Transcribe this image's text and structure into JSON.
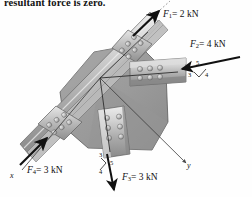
{
  "figure": {
    "caption_fragment": "resultant force is zero.",
    "type": "engineering-statics-diagram"
  },
  "axes": {
    "x_label": "x",
    "y_label": "y",
    "origin": {
      "x": 100,
      "y": 78
    },
    "x_end": {
      "x": 20,
      "y": 172
    },
    "y_end": {
      "x": 188,
      "y": 165
    }
  },
  "forces": [
    {
      "id": "F1",
      "name": "F1",
      "symbol": "F",
      "subscript": "1",
      "equals": "=",
      "magnitude": "2",
      "unit": "kN",
      "label": "F1 = 2 kN",
      "direction": "up-right",
      "tail": {
        "x": 133,
        "y": 35
      },
      "head": {
        "x": 160,
        "y": 10
      },
      "label_pos": {
        "x": 163,
        "y": 11
      },
      "slope_triangle": null
    },
    {
      "id": "F2",
      "name": "F2",
      "symbol": "F",
      "subscript": "2",
      "equals": "=",
      "magnitude": "4",
      "unit": "kN",
      "label": "F2 = 4 kN",
      "direction": "left (toward plate, 3-4-5 slope)",
      "tail": {
        "x": 238,
        "y": 58
      },
      "head": {
        "x": 178,
        "y": 70
      },
      "label_pos": {
        "x": 190,
        "y": 42
      },
      "slope_triangle": {
        "rise": "3",
        "run": "4",
        "hyp": "5"
      }
    },
    {
      "id": "F3",
      "name": "F3",
      "symbol": "F",
      "subscript": "3",
      "equals": "=",
      "magnitude": "3",
      "unit": "kN",
      "label": "F3 = 3 kN",
      "direction": "down (3-4-5 slope)",
      "tail": {
        "x": 107,
        "y": 155
      },
      "head": {
        "x": 115,
        "y": 192
      },
      "label_pos": {
        "x": 122,
        "y": 177
      },
      "slope_triangle": {
        "rise": "3",
        "run": "4",
        "hyp": "5"
      }
    },
    {
      "id": "F4",
      "name": "F4",
      "symbol": "F",
      "subscript": "4",
      "equals": "=",
      "magnitude": "3",
      "unit": "kN",
      "label": "F4 = 3 kN",
      "direction": "up-right (along x toward plate)",
      "tail": {
        "x": 22,
        "y": 163
      },
      "head": {
        "x": 47,
        "y": 137
      },
      "label_pos": {
        "x": 27,
        "y": 168
      },
      "slope_triangle": null
    }
  ],
  "members": [
    {
      "id": "member-f1",
      "attached_force": "F1",
      "bolts": 6,
      "bolt_rows": 2,
      "bolt_cols": 3
    },
    {
      "id": "member-f2",
      "attached_force": "F2",
      "bolts": 6,
      "bolt_rows": 2,
      "bolt_cols": 3
    },
    {
      "id": "member-f3",
      "attached_force": "F3",
      "bolts": 6,
      "bolt_rows": 2,
      "bolt_cols": 3
    },
    {
      "id": "member-f4",
      "attached_force": "F4",
      "bolts": 6,
      "bolt_rows": 2,
      "bolt_cols": 3
    }
  ],
  "colors": {
    "plate_fill": "#9c9c9c",
    "plate_fill_dark": "#848484",
    "plate_edge": "#5d5d5d",
    "member_light": "#d6d6d6",
    "member_mid": "#b4b4b4",
    "member_dark": "#8e8e8e",
    "bolt": "#bdbdbd",
    "bolt_shadow": "#6e6e6e",
    "arrow": "#111111",
    "axis_line": "#333333",
    "text": "#111111",
    "background": "#ffffff"
  }
}
